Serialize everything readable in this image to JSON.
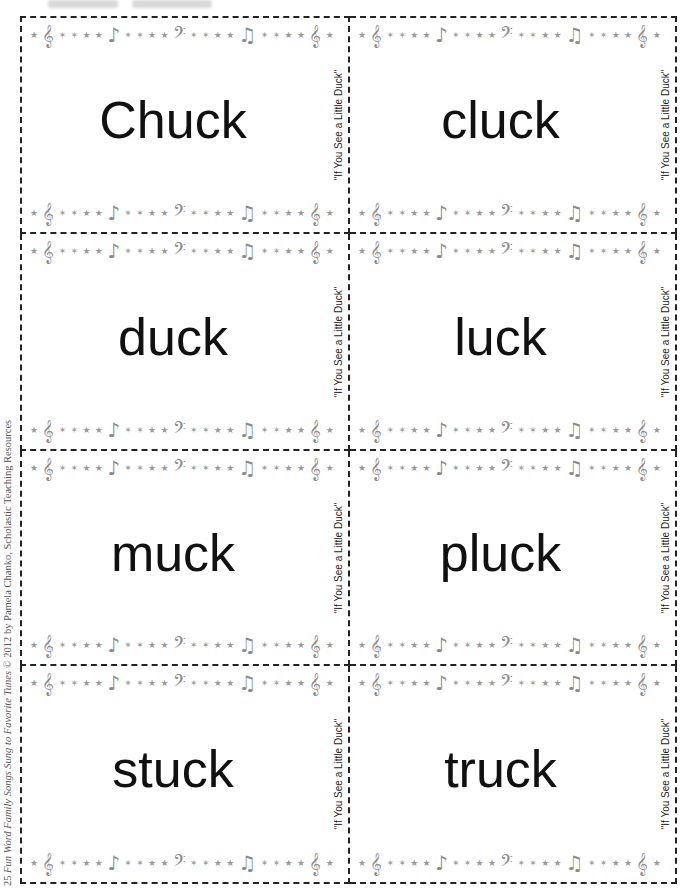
{
  "page": {
    "credit": {
      "prefix": "25 ",
      "title": "Fun Word Family Songs Sung to Favorite Tunes",
      "suffix": " © 2012 by Pamela Chanko, Scholastic Teaching Resources"
    }
  },
  "ornament": {
    "symbols": [
      "★",
      "𝄞",
      "✶",
      "✶",
      "★",
      "★",
      "♪",
      "✶",
      "✶",
      "★",
      "★",
      "𝄢",
      "✶",
      "✶",
      "★",
      "★",
      "♫",
      "✶",
      "✶",
      "★",
      "★",
      "𝄞",
      "★"
    ],
    "color": "#9a9a9a"
  },
  "cards": [
    {
      "word": "Chuck",
      "song": "\"If You See a Little Duck\""
    },
    {
      "word": "cluck",
      "song": "\"If You See a Little Duck\""
    },
    {
      "word": "duck",
      "song": "\"If You See a Little Duck\""
    },
    {
      "word": "luck",
      "song": "\"If You See a Little Duck\""
    },
    {
      "word": "muck",
      "song": "\"If You See a Little Duck\""
    },
    {
      "word": "pluck",
      "song": "\"If You See a Little Duck\""
    },
    {
      "word": "stuck",
      "song": "\"If You See a Little Duck\""
    },
    {
      "word": "truck",
      "song": "\"If You See a Little Duck\""
    }
  ]
}
